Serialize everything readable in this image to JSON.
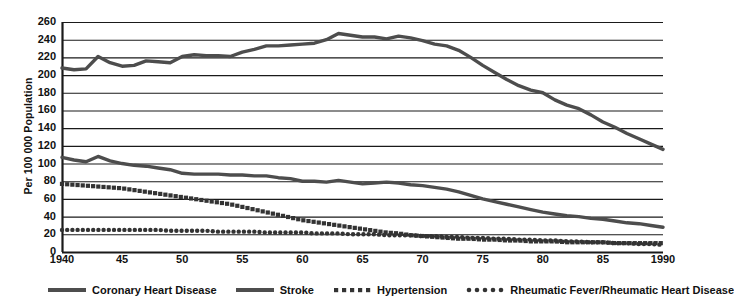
{
  "axes": {
    "ylabel": "Per 100 000 Population",
    "yticks": [
      0,
      20,
      40,
      60,
      80,
      100,
      120,
      140,
      160,
      180,
      200,
      220,
      240,
      260
    ],
    "xticks": [
      "1940",
      "45",
      "50",
      "55",
      "60",
      "65",
      "70",
      "75",
      "80",
      "85",
      "1990"
    ],
    "xtick_values": [
      1940,
      1945,
      1950,
      1955,
      1960,
      1965,
      1970,
      1975,
      1980,
      1985,
      1990
    ]
  },
  "legend": [
    {
      "label": "Coronary Heart Disease",
      "style": "solid-thick",
      "color": "#4d4d4d"
    },
    {
      "label": "Stroke",
      "style": "solid-thick",
      "color": "#4d4d4d"
    },
    {
      "label": "Hypertension",
      "style": "square-dots",
      "color": "#333333"
    },
    {
      "label": "Rheumatic Fever/Rheumatic Heart Disease",
      "style": "round-dots",
      "color": "#333333"
    }
  ],
  "chart_data": {
    "type": "line",
    "title": "",
    "xlabel": "",
    "ylabel": "Per 100 000 Population",
    "xlim": [
      1940,
      1990
    ],
    "ylim": [
      0,
      260
    ],
    "grid": "horizontal",
    "legend_position": "bottom",
    "x": [
      1940,
      1941,
      1942,
      1943,
      1944,
      1945,
      1946,
      1947,
      1948,
      1949,
      1950,
      1951,
      1952,
      1953,
      1954,
      1955,
      1956,
      1957,
      1958,
      1959,
      1960,
      1961,
      1962,
      1963,
      1964,
      1965,
      1966,
      1967,
      1968,
      1969,
      1970,
      1971,
      1972,
      1973,
      1974,
      1975,
      1976,
      1977,
      1978,
      1979,
      1980,
      1981,
      1982,
      1983,
      1984,
      1985,
      1986,
      1987,
      1988,
      1989,
      1990
    ],
    "series": [
      {
        "name": "Coronary Heart Disease",
        "style": "solid-thick",
        "color": "#4d4d4d",
        "values": [
          208,
          206,
          207,
          221,
          214,
          210,
          211,
          216,
          215,
          214,
          221,
          223,
          222,
          222,
          221,
          226,
          229,
          233,
          233,
          234,
          235,
          236,
          240,
          247,
          245,
          243,
          243,
          241,
          244,
          242,
          239,
          235,
          233,
          228,
          220,
          211,
          203,
          195,
          188,
          183,
          180,
          172,
          166,
          162,
          155,
          147,
          141,
          134,
          128,
          122,
          116
        ]
      },
      {
        "name": "Stroke",
        "style": "solid-thick",
        "color": "#4d4d4d",
        "values": [
          107,
          104,
          102,
          108,
          103,
          100,
          98,
          97,
          95,
          93,
          89,
          88,
          88,
          88,
          87,
          87,
          86,
          86,
          84,
          83,
          80,
          80,
          79,
          81,
          79,
          77,
          78,
          79,
          78,
          76,
          75,
          73,
          71,
          68,
          64,
          60,
          57,
          54,
          51,
          48,
          45,
          43,
          41,
          40,
          38,
          37,
          35,
          33,
          32,
          30,
          28
        ]
      },
      {
        "name": "Hypertension",
        "style": "square-dots",
        "color": "#333333",
        "values": [
          77,
          76,
          75,
          74,
          73,
          72,
          70,
          68,
          66,
          64,
          62,
          60,
          58,
          56,
          54,
          51,
          48,
          45,
          42,
          39,
          36,
          34,
          32,
          30,
          28,
          26,
          24,
          22,
          21,
          19,
          18,
          17,
          16,
          15,
          15,
          14,
          14,
          13,
          13,
          12,
          12,
          12,
          11,
          11,
          11,
          11,
          10,
          10,
          10,
          10,
          10
        ]
      },
      {
        "name": "Rheumatic Fever/Rheumatic Heart Disease",
        "style": "round-dots",
        "color": "#333333",
        "values": [
          25,
          25,
          25,
          25,
          25,
          25,
          25,
          25,
          25,
          24,
          24,
          24,
          24,
          23,
          23,
          23,
          23,
          22,
          22,
          22,
          22,
          21,
          21,
          21,
          20,
          20,
          20,
          19,
          19,
          19,
          18,
          18,
          17,
          17,
          16,
          16,
          15,
          15,
          14,
          14,
          13,
          13,
          12,
          12,
          11,
          11,
          10,
          10,
          9,
          9,
          8
        ]
      }
    ]
  }
}
